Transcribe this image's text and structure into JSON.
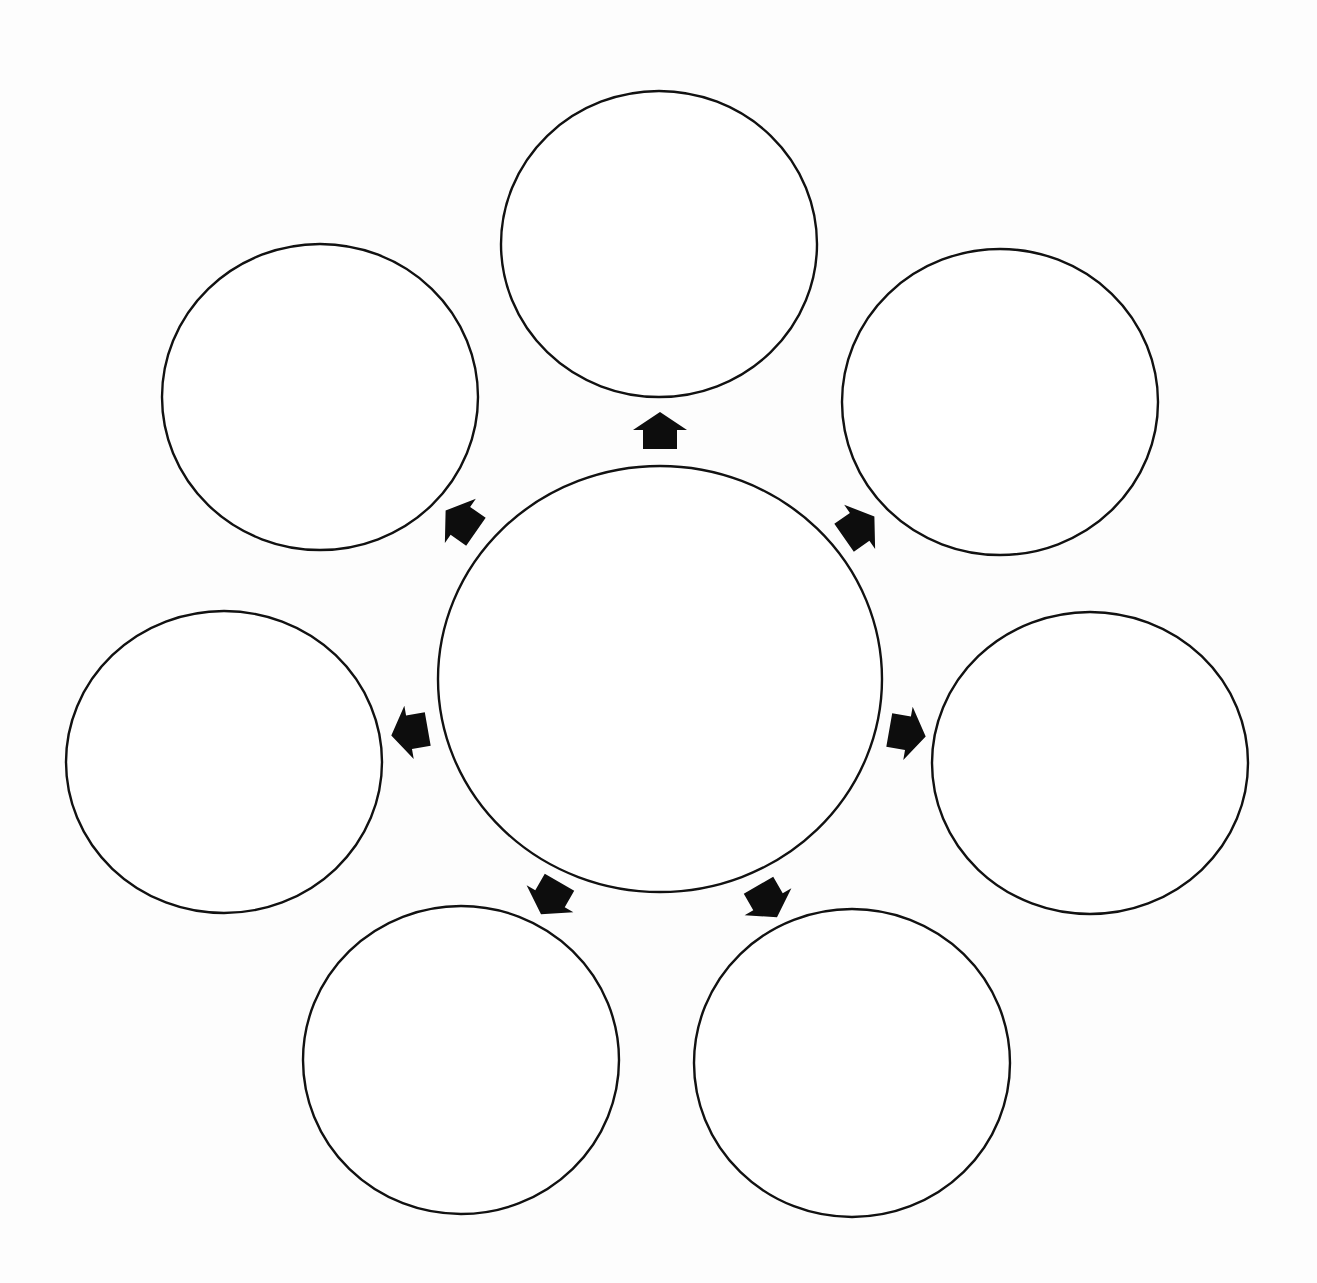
{
  "diagram": {
    "type": "cluster-web-graphic-organizer",
    "background_color": "#fdfdfd",
    "stroke_color": "#111111",
    "arrow_color": "#0d0d0d",
    "center_bubble": {
      "label": "",
      "cx": 660,
      "cy": 679,
      "rx": 222,
      "ry": 213
    },
    "outer_bubbles": [
      {
        "id": "top",
        "label": "",
        "cx": 659,
        "cy": 244,
        "rx": 158,
        "ry": 153
      },
      {
        "id": "top-right",
        "label": "",
        "cx": 1000,
        "cy": 402,
        "rx": 158,
        "ry": 153
      },
      {
        "id": "right",
        "label": "",
        "cx": 1090,
        "cy": 763,
        "rx": 158,
        "ry": 151
      },
      {
        "id": "bottom-right",
        "label": "",
        "cx": 852,
        "cy": 1063,
        "rx": 158,
        "ry": 154
      },
      {
        "id": "bottom-left",
        "label": "",
        "cx": 461,
        "cy": 1060,
        "rx": 158,
        "ry": 154
      },
      {
        "id": "left",
        "label": "",
        "cx": 224,
        "cy": 762,
        "rx": 158,
        "ry": 151
      },
      {
        "id": "top-left",
        "label": "",
        "cx": 320,
        "cy": 397,
        "rx": 158,
        "ry": 153
      }
    ],
    "arrows": [
      {
        "id": "arrow-top",
        "x": 660,
        "y": 432,
        "angle": 0
      },
      {
        "id": "arrow-top-right",
        "x": 858,
        "y": 528,
        "angle": 55
      },
      {
        "id": "arrow-right",
        "x": 906,
        "y": 733,
        "angle": 100
      },
      {
        "id": "arrow-bottom-right",
        "x": 767,
        "y": 900,
        "angle": 150
      },
      {
        "id": "arrow-bottom-left",
        "x": 551,
        "y": 897,
        "angle": 210
      },
      {
        "id": "arrow-left",
        "x": 411,
        "y": 732,
        "angle": 260
      },
      {
        "id": "arrow-top-left",
        "x": 462,
        "y": 522,
        "angle": 305
      }
    ]
  }
}
